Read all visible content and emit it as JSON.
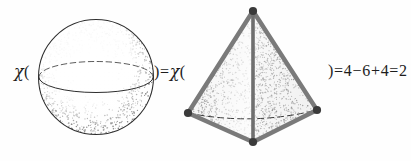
{
  "figure": {
    "background_color": "#fefefe",
    "ink_color": "#1d1d1d",
    "stipple_color": "#5a5a5a",
    "edge_color": "#6e6e6e",
    "vertex_color": "#3a3a3a"
  },
  "expressions": {
    "left": {
      "chi": "χ",
      "open_paren": "("
    },
    "middle": {
      "close_paren": ")",
      "equals": "=",
      "chi": "χ",
      "open_paren": "("
    },
    "right": {
      "close_paren": ")",
      "equals_1": "=",
      "faces": "4",
      "minus": "−",
      "edges": "6",
      "plus": "+",
      "vertices": "4",
      "equals_2": "=",
      "result": "2"
    }
  },
  "shapes": {
    "sphere": {
      "label": "sphere",
      "center_x": 96,
      "center_y": 77,
      "radius": 58,
      "equator_ry": 14,
      "stipple_dots": 900
    },
    "tetrahedron": {
      "label": "tetrahedron",
      "vertices": [
        {
          "name": "apex",
          "x": 253,
          "y": 11
        },
        {
          "name": "left",
          "x": 188,
          "y": 113
        },
        {
          "name": "right",
          "x": 317,
          "y": 110
        },
        {
          "name": "bottom",
          "x": 253,
          "y": 142
        }
      ],
      "edge_count": 6,
      "face_count": 4,
      "vertex_count": 4,
      "stipple_dots": 1100
    }
  }
}
